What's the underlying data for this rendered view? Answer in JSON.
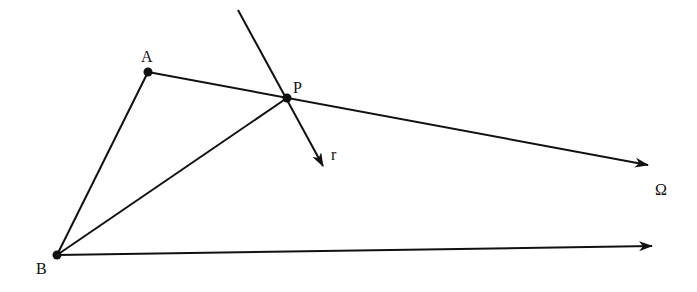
{
  "diagram": {
    "points": [
      {
        "id": "A",
        "label": "A",
        "x": 148,
        "y": 72,
        "label_x": 141,
        "label_y": 62
      },
      {
        "id": "P",
        "label": "P",
        "x": 287,
        "y": 98,
        "label_x": 293,
        "label_y": 93
      },
      {
        "id": "B",
        "label": "B",
        "x": 57,
        "y": 255,
        "label_x": 36,
        "label_y": 274
      }
    ],
    "labels": {
      "r": {
        "text": "r",
        "x": 331,
        "y": 160
      },
      "omega": {
        "text": "Ω",
        "x": 655,
        "y": 195
      }
    },
    "segments": [
      {
        "from": "A",
        "to": "B"
      },
      {
        "from": "B",
        "to": "P"
      }
    ],
    "rays": [
      {
        "name": "ray-A-through-P-to-omega",
        "x1": 148,
        "y1": 72,
        "x2": 648,
        "y2": 165,
        "arrow": true
      },
      {
        "name": "ray-B-to-omega",
        "x1": 57,
        "y1": 255,
        "x2": 652,
        "y2": 246,
        "arrow": true
      },
      {
        "name": "ray-r-through-P",
        "x1": 238,
        "y1": 10,
        "x2": 323,
        "y2": 166,
        "arrow": true
      }
    ],
    "stroke_color": "#111111",
    "background": "#ffffff"
  }
}
